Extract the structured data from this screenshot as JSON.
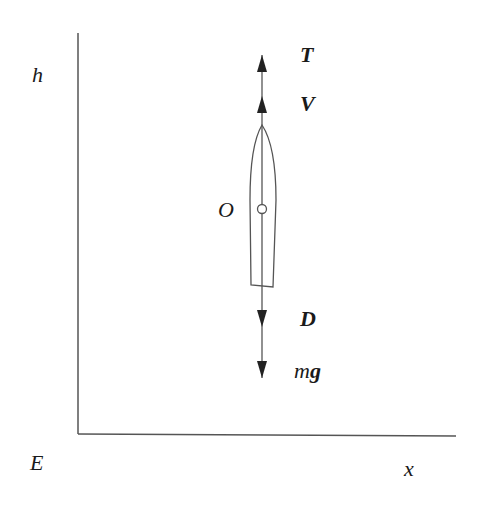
{
  "diagram": {
    "axes": {
      "vertical_label": "h",
      "horizontal_label": "x",
      "origin_label": "E"
    },
    "body": {
      "center_label": "O"
    },
    "forces": [
      {
        "label": "T",
        "direction": "up",
        "bold": true
      },
      {
        "label": "V",
        "direction": "up",
        "bold": true
      },
      {
        "label": "D",
        "direction": "down",
        "bold": true
      },
      {
        "label_prefix": "m",
        "label_suffix": "g",
        "direction": "down"
      }
    ],
    "colors": {
      "stroke": "#555555",
      "text": "#1a1a1a",
      "background": "#ffffff"
    }
  }
}
